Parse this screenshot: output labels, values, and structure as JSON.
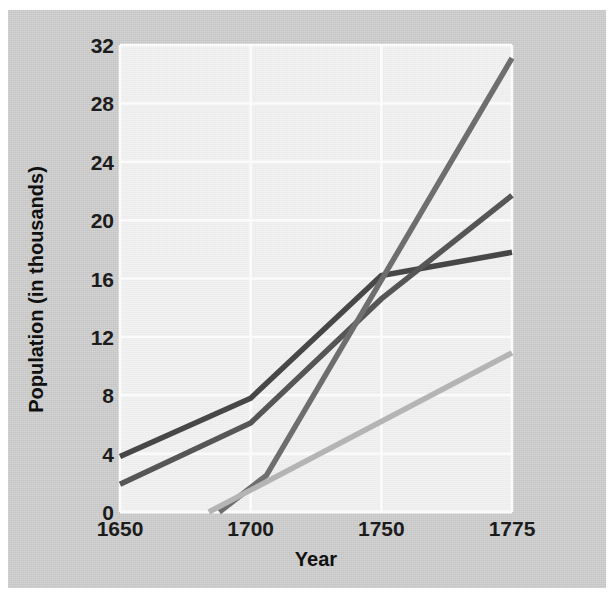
{
  "chart_data": {
    "type": "line",
    "title": "",
    "xlabel": "Year",
    "ylabel": "Population (in thousands)",
    "x_tick_labels": [
      "1650",
      "1700",
      "1750",
      "1775"
    ],
    "x_tick_values": [
      1650,
      1700,
      1750,
      1775
    ],
    "y_tick_labels": [
      "0",
      "4",
      "8",
      "12",
      "16",
      "20",
      "24",
      "28",
      "32"
    ],
    "y_tick_values": [
      0,
      4,
      8,
      12,
      16,
      20,
      24,
      28,
      32
    ],
    "ylim": [
      0,
      32
    ],
    "grid": true,
    "legend": "none",
    "axis_note": "x-axis tick spacing is categorical/uneven: 1650-1700-1750-1775 are evenly spaced in pixels",
    "series": [
      {
        "name": "series-1-darkest",
        "color": "#474747",
        "points": [
          {
            "x": 1650,
            "y": 3.8
          },
          {
            "x": 1700,
            "y": 7.8
          },
          {
            "x": 1750,
            "y": 16.2
          },
          {
            "x": 1775,
            "y": 17.8
          }
        ]
      },
      {
        "name": "series-2-dark",
        "color": "#565656",
        "points": [
          {
            "x": 1650,
            "y": 1.9
          },
          {
            "x": 1700,
            "y": 6.1
          },
          {
            "x": 1750,
            "y": 14.6
          },
          {
            "x": 1775,
            "y": 21.7
          }
        ]
      },
      {
        "name": "series-3-medium",
        "color": "#6e6e6e",
        "points": [
          {
            "x": 1688,
            "y": 0.0
          },
          {
            "x": 1706,
            "y": 2.5
          },
          {
            "x": 1775,
            "y": 31.1
          }
        ]
      },
      {
        "name": "series-4-light",
        "color": "#b4b4b4",
        "points": [
          {
            "x": 1684,
            "y": 0.0
          },
          {
            "x": 1775,
            "y": 10.9
          }
        ]
      }
    ]
  },
  "colors": {
    "page_background": "#ffffff",
    "paper": "#c9c9c9",
    "panel": "#eeeeee",
    "gridline": "#fbfbfb",
    "text": "#1c1c1c"
  }
}
